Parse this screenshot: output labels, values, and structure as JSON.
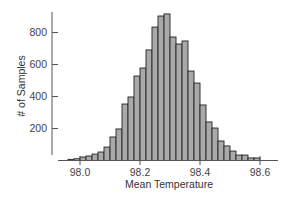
{
  "chart_data": {
    "type": "bar",
    "subtype": "histogram",
    "title": "",
    "xlabel": "Mean Temperature",
    "ylabel": "# of Samples",
    "x_ticks": [
      "98.0",
      "98.2",
      "98.4",
      "98.6"
    ],
    "x_tick_values": [
      98.0,
      98.2,
      98.4,
      98.6
    ],
    "y_ticks": [
      "200",
      "400",
      "600",
      "800"
    ],
    "y_tick_values": [
      200,
      400,
      600,
      800
    ],
    "xlim": [
      97.94,
      98.66
    ],
    "ylim": [
      0,
      900
    ],
    "bin_width": 0.02,
    "grid": false,
    "legend": null,
    "bin_starts": [
      97.96,
      97.98,
      98.0,
      98.02,
      98.04,
      98.06,
      98.08,
      98.1,
      98.12,
      98.14,
      98.16,
      98.18,
      98.2,
      98.22,
      98.24,
      98.26,
      98.28,
      98.3,
      98.32,
      98.34,
      98.36,
      98.38,
      98.4,
      98.42,
      98.44,
      98.46,
      98.48,
      98.5,
      98.52,
      98.54,
      98.56,
      98.58
    ],
    "values": [
      7,
      11,
      22,
      28,
      40,
      53,
      84,
      147,
      197,
      353,
      397,
      528,
      578,
      691,
      834,
      903,
      916,
      772,
      728,
      747,
      559,
      484,
      347,
      241,
      203,
      122,
      91,
      59,
      34,
      34,
      16,
      16
    ],
    "colors": {
      "bar_fill": "#a9a9a9",
      "bar_edge": "#222222",
      "axis": "#555555"
    }
  }
}
